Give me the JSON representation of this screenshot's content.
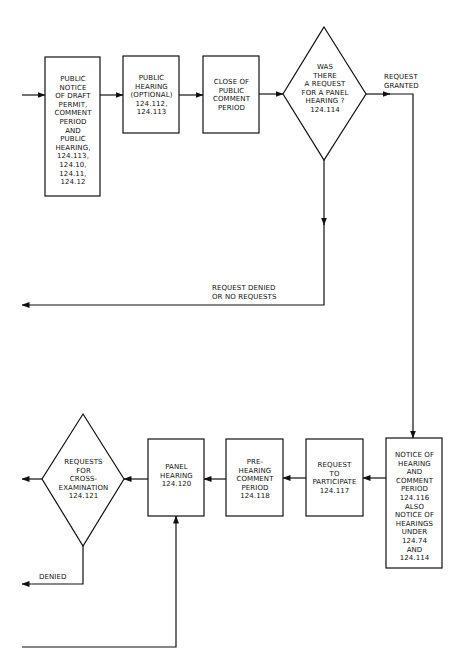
{
  "page_corner_text": "",
  "nodes": {
    "public_notice": {
      "text": "PUBLIC\nNOTICE\nOF DRAFT\nPERMIT,\nCOMMENT\nPERIOD\nAND\nPUBLIC\nHEARING,\n124.113,\n124.10,\n124.11,\n124.12",
      "shape": "rectangle"
    },
    "public_hearing_optional": {
      "text": "PUBLIC\nHEARING\n(OPTIONAL)\n124.112,\n124.113",
      "shape": "rectangle"
    },
    "close_of_comment": {
      "text": "CLOSE OF\nPUBLIC\nCOMMENT\nPERIOD",
      "shape": "rectangle"
    },
    "panel_request_decision": {
      "text": "WAS\nTHERE\nA REQUEST\nFOR A PANEL\nHEARING ?\n124.114",
      "shape": "diamond"
    },
    "notice_of_hearing": {
      "text": "NOTICE OF\nHEARING\nAND\nCOMMENT\nPERIOD\n124.116\nALSO\nNOTICE OF\nHEARINGS\nUNDER\n124.74\nAND\n124.114",
      "shape": "rectangle"
    },
    "request_to_participate": {
      "text": "REQUEST\nTO\nPARTICIPATE\n124.117",
      "shape": "rectangle"
    },
    "pre_hearing_comment": {
      "text": "PRE-\nHEARING\nCOMMENT\nPERIOD\n124.118",
      "shape": "rectangle"
    },
    "panel_hearing": {
      "text": "PANEL\nHEARING\n124.120",
      "shape": "rectangle"
    },
    "cross_exam_decision": {
      "text": "REQUESTS\nFOR\nCROSS-\nEXAMINATION\n124.121",
      "shape": "diamond"
    }
  },
  "edge_labels": {
    "request_granted": "REQUEST\nGRANTED",
    "request_denied": "REQUEST DENIED\nOR NO REQUESTS",
    "denied": "DENIED"
  },
  "edges": [
    {
      "from": "incoming",
      "to": "public_notice"
    },
    {
      "from": "public_notice",
      "to": "public_hearing_optional"
    },
    {
      "from": "public_hearing_optional",
      "to": "close_of_comment"
    },
    {
      "from": "close_of_comment",
      "to": "panel_request_decision"
    },
    {
      "from": "panel_request_decision",
      "to": "notice_of_hearing",
      "label": "REQUEST GRANTED"
    },
    {
      "from": "panel_request_decision",
      "to": "exit_left",
      "label": "REQUEST DENIED OR NO REQUESTS"
    },
    {
      "from": "notice_of_hearing",
      "to": "request_to_participate"
    },
    {
      "from": "request_to_participate",
      "to": "pre_hearing_comment"
    },
    {
      "from": "pre_hearing_comment",
      "to": "panel_hearing"
    },
    {
      "from": "panel_hearing",
      "to": "cross_exam_decision"
    },
    {
      "from": "cross_exam_decision",
      "to": "exit_left"
    },
    {
      "from": "cross_exam_decision",
      "to": "exit_left",
      "label": "DENIED"
    },
    {
      "from": "incoming_bottom",
      "to": "panel_hearing"
    }
  ],
  "colors": {
    "line": "#111111",
    "background": "#ffffff"
  }
}
